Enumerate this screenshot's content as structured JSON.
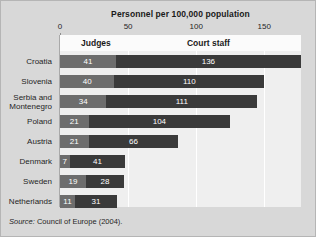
{
  "chart_data": {
    "type": "bar",
    "orientation": "horizontal",
    "stacked": true,
    "title": "Personnel per 100,000 population",
    "xlabel": "",
    "ylabel": "",
    "xlim": [
      0,
      177
    ],
    "xticks": [
      0,
      50,
      100,
      150
    ],
    "xtick_labels": [
      "0",
      "50",
      "100",
      "150"
    ],
    "grid": "vertical-white",
    "legend_position": "column-headers-top",
    "categories": [
      "Croatia",
      "Slovenia",
      "Serbia and\nMontenegro",
      "Poland",
      "Austria",
      "Denmark",
      "Sweden",
      "Netherlands"
    ],
    "series": [
      {
        "name": "Judges",
        "color": "#6d6d6d",
        "values": [
          41,
          40,
          34,
          21,
          21,
          7,
          19,
          11
        ]
      },
      {
        "name": "Court staff",
        "color": "#3a3a3a",
        "values": [
          136,
          110,
          111,
          104,
          66,
          41,
          28,
          31
        ]
      }
    ],
    "column_headers": [
      "Judges",
      "Court staff"
    ],
    "source": {
      "label": "Source:",
      "text": "Council of Europe (2004)."
    }
  },
  "colors": {
    "page_background": "#d8d8d8",
    "plot_background": "#efefef",
    "header_band": "#fbfbfb",
    "judges": "#6d6d6d",
    "court_staff": "#3a3a3a",
    "gridline": "#ffffff",
    "axis": "#a9a9a9",
    "text": "#1a1a1a"
  }
}
